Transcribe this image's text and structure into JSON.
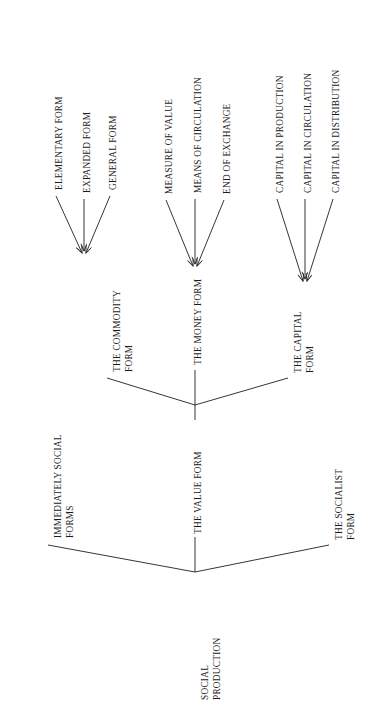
{
  "diagram": {
    "type": "tree",
    "orientation": "rotated-90-ccw",
    "title": "",
    "line_color": "#2b2b2b",
    "background_color": "#ffffff",
    "text_color": "#1a1a1a",
    "root": {
      "id": "social-production",
      "label": "SOCIAL\nPRODUCTION",
      "children": [
        {
          "id": "immediately-social-forms",
          "label": "IMMEDIATELY SOCIAL\nFORMS",
          "children": []
        },
        {
          "id": "the-value-form",
          "label": "THE VALUE FORM",
          "children": [
            {
              "id": "the-commodity-form",
              "label": "THE COMMODITY\nFORM",
              "children": [
                {
                  "id": "elementary-form",
                  "label": "ELEMENTARY FORM"
                },
                {
                  "id": "expanded-form",
                  "label": "EXPANDED FORM"
                },
                {
                  "id": "general-form",
                  "label": "GENERAL FORM"
                }
              ]
            },
            {
              "id": "the-money-form",
              "label": "THE MONEY FORM",
              "children": [
                {
                  "id": "measure-of-value",
                  "label": "MEASURE OF VALUE"
                },
                {
                  "id": "means-of-circulation",
                  "label": "MEANS OF CIRCULATION"
                },
                {
                  "id": "end-of-exchange",
                  "label": "END OF EXCHANGE"
                }
              ]
            },
            {
              "id": "the-capital-form",
              "label": "THE CAPITAL\nFORM",
              "children": [
                {
                  "id": "capital-in-production",
                  "label": "CAPITAL IN PRODUCTION"
                },
                {
                  "id": "capital-in-circulation",
                  "label": "CAPITAL IN CIRCULATION"
                },
                {
                  "id": "capital-in-distribution",
                  "label": "CAPITAL IN DISTRIBUTION"
                }
              ]
            }
          ]
        },
        {
          "id": "the-socialist-form",
          "label": "THE SOCIALIST\nFORM",
          "children": []
        }
      ]
    },
    "labels": {
      "social_production": "SOCIAL\nPRODUCTION",
      "immediately_social_forms": "IMMEDIATELY SOCIAL\nFORMS",
      "the_value_form": "THE VALUE FORM",
      "the_socialist_form": "THE SOCIALIST\nFORM",
      "the_commodity_form": "THE COMMODITY\nFORM",
      "the_money_form": "THE MONEY FORM",
      "the_capital_form": "THE CAPITAL\nFORM",
      "elementary_form": "ELEMENTARY FORM",
      "expanded_form": "EXPANDED FORM",
      "general_form": "GENERAL FORM",
      "measure_of_value": "MEASURE OF VALUE",
      "means_of_circulation": "MEANS OF CIRCULATION",
      "end_of_exchange": "END OF EXCHANGE",
      "capital_in_production": "CAPITAL IN PRODUCTION",
      "capital_in_circulation": "CAPITAL IN CIRCULATION",
      "capital_in_distribution": "CAPITAL IN DISTRIBUTION"
    }
  }
}
